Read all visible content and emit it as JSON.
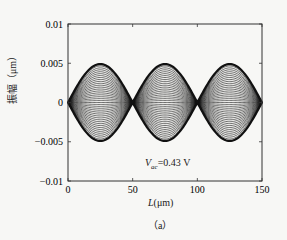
{
  "chart_data": {
    "type": "line",
    "title": "",
    "xlabel_var": "L",
    "xlabel_unit": "(μm)",
    "ylabel": "振幅（μm）",
    "xlim": [
      0,
      150
    ],
    "ylim": [
      -0.01,
      0.01
    ],
    "xticks": [
      0,
      50,
      100,
      150
    ],
    "xtick_labels": [
      "0",
      "50",
      "100",
      "150"
    ],
    "yticks": [
      0.01,
      0.005,
      0,
      -0.005,
      -0.01
    ],
    "ytick_labels": [
      "0.01",
      "0.005",
      "0",
      "-0.005",
      "-0.01"
    ],
    "grid": false,
    "legend": null,
    "annotation": {
      "var": "V",
      "sub": "ac",
      "text": "=0.43 V"
    },
    "caption": "（a）",
    "series_description": "Family of mode-shape curves: three-lobe standing wave (third mode) with amplitudes scaled from -max to +max; envelope peaks at ≈±0.005 near L≈25, 75, 125; nodes at L≈0, 50, 100, 150",
    "envelope": {
      "x": [
        0,
        25,
        50,
        75,
        100,
        125,
        150
      ],
      "y_max": [
        0,
        0.0049,
        0,
        0.0049,
        0,
        0.0049,
        0
      ]
    },
    "num_curves": 40,
    "line_color": "#111111"
  }
}
